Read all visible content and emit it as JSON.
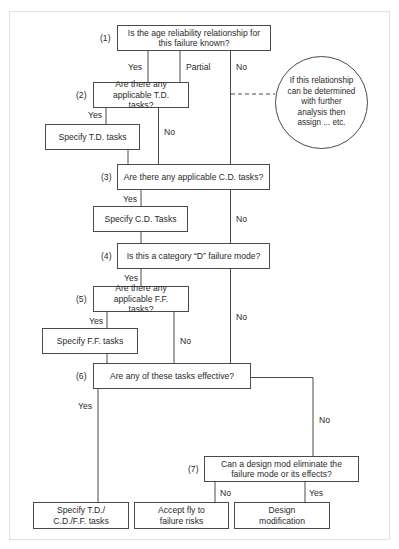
{
  "diagram": {
    "type": "decision-flowchart",
    "nodes": {
      "q1": {
        "number": "(1)",
        "text": "Is the age reliability relationship for this failure known?"
      },
      "q2": {
        "number": "(2)",
        "text": "Are there any applicable T.D. tasks?"
      },
      "a_td": {
        "text": "Specify T.D. tasks"
      },
      "q3": {
        "number": "(3)",
        "text": "Are there any applicable C.D. tasks?"
      },
      "a_cd": {
        "text": "Specify C.D. Tasks"
      },
      "q4": {
        "number": "(4)",
        "text": "Is this a category “D” failure mode?"
      },
      "q5": {
        "number": "(5)",
        "text": "Are there any applicable F.F. tasks?"
      },
      "a_ff": {
        "text": "Specify F.F. tasks"
      },
      "q6": {
        "number": "(6)",
        "text": "Are any of these tasks effective?"
      },
      "q7": {
        "number": "(7)",
        "text": "Can a design mod eliminate the failure mode or its effects?"
      },
      "end_specify": {
        "text": "Specify T.D./ C.D./F.F. tasks"
      },
      "end_accept": {
        "text": "Accept fly to failure risks"
      },
      "end_design": {
        "text": "Design modification"
      },
      "note": {
        "text": "If this relationship can be determined with further analysis then assign ... etc."
      }
    },
    "edge_labels": {
      "q1_yes": "Yes",
      "q1_partial": "Partial",
      "q1_no": "No",
      "q2_yes": "Yes",
      "q2_no": "No",
      "q3_yes": "Yes",
      "q3_no": "No",
      "q4_yes": "Yes",
      "q4_no": "No",
      "q5_yes": "Yes",
      "q5_no": "No",
      "q6_yes": "Yes",
      "q6_no": "No",
      "q7_no": "No",
      "q7_yes": "Yes"
    },
    "colors": {
      "line": "#4a4a4a",
      "text": "#2a2a2a",
      "frame": "#e2e2e2"
    }
  }
}
